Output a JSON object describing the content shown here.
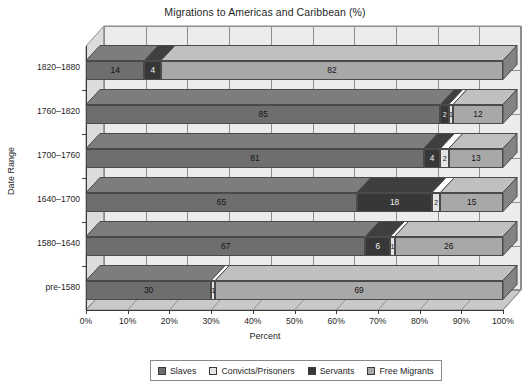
{
  "chart_data": {
    "type": "bar",
    "subtype": "stacked-horizontal-3d",
    "title": "Migrations to Americas and Caribbean (%)",
    "xlabel": "Percent",
    "ylabel": "Date Range",
    "xlim": [
      0,
      100
    ],
    "grid": true,
    "legend_position": "bottom",
    "xticks": [
      "0%",
      "10%",
      "20%",
      "30%",
      "40%",
      "50%",
      "60%",
      "70%",
      "80%",
      "90%",
      "100%"
    ],
    "xtick_values": [
      0,
      10,
      20,
      30,
      40,
      50,
      60,
      70,
      80,
      90,
      100
    ],
    "categories": [
      "1820–1880",
      "1760–1820",
      "1700–1760",
      "1640–1700",
      "1580–1640",
      "pre-1580"
    ],
    "series": [
      {
        "name": "Slaves",
        "color": "#6e6e6e",
        "values": [
          14,
          85,
          81,
          65,
          67,
          30
        ]
      },
      {
        "name": "Convicts/Prisoners",
        "color": "#e4e4e4",
        "values": [
          0,
          1,
          2,
          2,
          1,
          1
        ]
      },
      {
        "name": "Servants",
        "color": "#373737",
        "values": [
          4,
          2,
          4,
          18,
          6,
          0
        ]
      },
      {
        "name": "Free Migrants",
        "color": "#a8a8a8",
        "values": [
          82,
          12,
          13,
          15,
          26,
          69
        ]
      }
    ],
    "bar_labels": [
      [
        "14",
        "0",
        "4",
        "82"
      ],
      [
        "85",
        "1",
        "2",
        "12"
      ],
      [
        "81",
        "2",
        "4",
        "13"
      ],
      [
        "65",
        "2",
        "18",
        "15"
      ],
      [
        "67",
        "1",
        "6",
        "26"
      ],
      [
        "30",
        "1",
        "0",
        "69"
      ]
    ],
    "segment_order": [
      "Slaves",
      "Servants",
      "Convicts/Prisoners",
      "Free Migrants"
    ],
    "row_segments": [
      [
        {
          "series": "Slaves",
          "value": 14,
          "label": "14"
        },
        {
          "series": "Servants",
          "value": 4,
          "label": "4"
        },
        {
          "series": "Convicts/Prisoners",
          "value": 0,
          "label": "0"
        },
        {
          "series": "Free Migrants",
          "value": 82,
          "label": "82"
        }
      ],
      [
        {
          "series": "Slaves",
          "value": 85,
          "label": "85"
        },
        {
          "series": "Servants",
          "value": 2,
          "label": "2"
        },
        {
          "series": "Convicts/Prisoners",
          "value": 1,
          "label": "1"
        },
        {
          "series": "Free Migrants",
          "value": 12,
          "label": "12"
        }
      ],
      [
        {
          "series": "Slaves",
          "value": 81,
          "label": "81"
        },
        {
          "series": "Servants",
          "value": 4,
          "label": "4"
        },
        {
          "series": "Convicts/Prisoners",
          "value": 2,
          "label": "2"
        },
        {
          "series": "Free Migrants",
          "value": 13,
          "label": "13"
        }
      ],
      [
        {
          "series": "Slaves",
          "value": 65,
          "label": "65"
        },
        {
          "series": "Servants",
          "value": 18,
          "label": "18"
        },
        {
          "series": "Convicts/Prisoners",
          "value": 2,
          "label": "2"
        },
        {
          "series": "Free Migrants",
          "value": 15,
          "label": "15"
        }
      ],
      [
        {
          "series": "Slaves",
          "value": 67,
          "label": "67"
        },
        {
          "series": "Servants",
          "value": 6,
          "label": "6"
        },
        {
          "series": "Convicts/Prisoners",
          "value": 1,
          "label": "1"
        },
        {
          "series": "Free Migrants",
          "value": 26,
          "label": "26"
        }
      ],
      [
        {
          "series": "Slaves",
          "value": 30,
          "label": "30"
        },
        {
          "series": "Servants",
          "value": 0,
          "label": "0"
        },
        {
          "series": "Convicts/Prisoners",
          "value": 1,
          "label": "1"
        },
        {
          "series": "Free Migrants",
          "value": 69,
          "label": "69"
        }
      ]
    ]
  },
  "legend": {
    "items": [
      {
        "label": "Slaves",
        "color": "#6e6e6e"
      },
      {
        "label": "Convicts/Prisoners",
        "color": "#e4e4e4"
      },
      {
        "label": "Servants",
        "color": "#373737"
      },
      {
        "label": "Free Migrants",
        "color": "#a8a8a8"
      }
    ]
  },
  "colors": {
    "plot_background": "#ececec",
    "wall_shade": "#dcdcdc",
    "floor_shade": "#c9c9c9",
    "grid": "#8f8f8f",
    "axis": "#3a3a3a",
    "page_background": "#ffffff"
  }
}
